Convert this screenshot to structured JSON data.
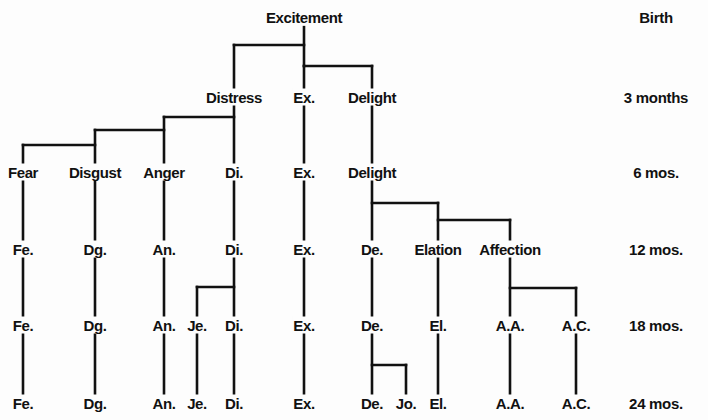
{
  "ages": [
    {
      "label": "Birth",
      "y": 17
    },
    {
      "label": "3 months",
      "y": 97
    },
    {
      "label": "6 mos.",
      "y": 172
    },
    {
      "label": "12 mos.",
      "y": 249
    },
    {
      "label": "18 mos.",
      "y": 325
    },
    {
      "label": "24 mos.",
      "y": 403
    }
  ],
  "nodes": [
    {
      "id": "excitement",
      "label": "Excitement",
      "x": 304,
      "y": 17
    },
    {
      "id": "distress-3",
      "label": "Distress",
      "x": 234,
      "y": 97
    },
    {
      "id": "ex-3",
      "label": "Ex.",
      "x": 304,
      "y": 97
    },
    {
      "id": "delight-3",
      "label": "Delight",
      "x": 372,
      "y": 97
    },
    {
      "id": "fear-6",
      "label": "Fear",
      "x": 23,
      "y": 172
    },
    {
      "id": "disgust-6",
      "label": "Disgust",
      "x": 95,
      "y": 172
    },
    {
      "id": "anger-6",
      "label": "Anger",
      "x": 164,
      "y": 172
    },
    {
      "id": "di-6",
      "label": "Di.",
      "x": 234,
      "y": 172
    },
    {
      "id": "ex-6",
      "label": "Ex.",
      "x": 304,
      "y": 172
    },
    {
      "id": "delight-6",
      "label": "Delight",
      "x": 372,
      "y": 172
    },
    {
      "id": "fe-12",
      "label": "Fe.",
      "x": 23,
      "y": 249
    },
    {
      "id": "dg-12",
      "label": "Dg.",
      "x": 95,
      "y": 249
    },
    {
      "id": "an-12",
      "label": "An.",
      "x": 164,
      "y": 249
    },
    {
      "id": "di-12",
      "label": "Di.",
      "x": 234,
      "y": 249
    },
    {
      "id": "ex-12",
      "label": "Ex.",
      "x": 304,
      "y": 249
    },
    {
      "id": "de-12",
      "label": "De.",
      "x": 372,
      "y": 249
    },
    {
      "id": "elation-12",
      "label": "Elation",
      "x": 438,
      "y": 249
    },
    {
      "id": "affection-12",
      "label": "Affection",
      "x": 510,
      "y": 249
    },
    {
      "id": "fe-18",
      "label": "Fe.",
      "x": 23,
      "y": 325
    },
    {
      "id": "dg-18",
      "label": "Dg.",
      "x": 95,
      "y": 325
    },
    {
      "id": "an-18",
      "label": "An.",
      "x": 164,
      "y": 325
    },
    {
      "id": "je-18",
      "label": "Je.",
      "x": 197,
      "y": 325
    },
    {
      "id": "di-18",
      "label": "Di.",
      "x": 234,
      "y": 325
    },
    {
      "id": "ex-18",
      "label": "Ex.",
      "x": 304,
      "y": 325
    },
    {
      "id": "de-18",
      "label": "De.",
      "x": 372,
      "y": 325
    },
    {
      "id": "el-18",
      "label": "El.",
      "x": 438,
      "y": 325
    },
    {
      "id": "aa-18",
      "label": "A.A.",
      "x": 510,
      "y": 325
    },
    {
      "id": "ac-18",
      "label": "A.C.",
      "x": 576,
      "y": 325
    },
    {
      "id": "fe-24",
      "label": "Fe.",
      "x": 23,
      "y": 403
    },
    {
      "id": "dg-24",
      "label": "Dg.",
      "x": 95,
      "y": 403
    },
    {
      "id": "an-24",
      "label": "An.",
      "x": 164,
      "y": 403
    },
    {
      "id": "je-24",
      "label": "Je.",
      "x": 197,
      "y": 403
    },
    {
      "id": "di-24",
      "label": "Di.",
      "x": 234,
      "y": 403
    },
    {
      "id": "ex-24",
      "label": "Ex.",
      "x": 304,
      "y": 403
    },
    {
      "id": "de-24",
      "label": "De.",
      "x": 372,
      "y": 403
    },
    {
      "id": "jo-24",
      "label": "Jo.",
      "x": 406,
      "y": 403
    },
    {
      "id": "el-24",
      "label": "El.",
      "x": 438,
      "y": 403
    },
    {
      "id": "aa-24",
      "label": "A.A.",
      "x": 510,
      "y": 403
    },
    {
      "id": "ac-24",
      "label": "A.C.",
      "x": 576,
      "y": 403
    }
  ],
  "lines": [
    [
      304,
      27,
      304,
      66
    ],
    [
      234,
      45,
      304,
      45
    ],
    [
      234,
      45,
      234,
      88
    ],
    [
      304,
      66,
      372,
      66
    ],
    [
      372,
      66,
      372,
      88
    ],
    [
      304,
      66,
      304,
      88
    ],
    [
      234,
      106,
      234,
      163
    ],
    [
      164,
      117,
      234,
      117
    ],
    [
      164,
      117,
      164,
      163
    ],
    [
      95,
      130,
      164,
      130
    ],
    [
      95,
      130,
      95,
      163
    ],
    [
      23,
      145,
      95,
      145
    ],
    [
      23,
      145,
      23,
      163
    ],
    [
      304,
      106,
      304,
      163
    ],
    [
      372,
      106,
      372,
      163
    ],
    [
      23,
      181,
      23,
      240
    ],
    [
      95,
      181,
      95,
      240
    ],
    [
      164,
      181,
      164,
      240
    ],
    [
      234,
      181,
      234,
      240
    ],
    [
      304,
      181,
      304,
      240
    ],
    [
      372,
      181,
      372,
      240
    ],
    [
      372,
      203,
      438,
      203
    ],
    [
      438,
      203,
      438,
      240
    ],
    [
      438,
      220,
      510,
      220
    ],
    [
      510,
      220,
      510,
      240
    ],
    [
      23,
      258,
      23,
      316
    ],
    [
      95,
      258,
      95,
      316
    ],
    [
      164,
      258,
      164,
      316
    ],
    [
      234,
      258,
      234,
      316
    ],
    [
      304,
      258,
      304,
      316
    ],
    [
      372,
      258,
      372,
      316
    ],
    [
      438,
      258,
      438,
      316
    ],
    [
      510,
      258,
      510,
      316
    ],
    [
      197,
      287,
      234,
      287
    ],
    [
      197,
      287,
      197,
      316
    ],
    [
      510,
      288,
      576,
      288
    ],
    [
      576,
      288,
      576,
      316
    ],
    [
      23,
      334,
      23,
      394
    ],
    [
      95,
      334,
      95,
      394
    ],
    [
      164,
      334,
      164,
      394
    ],
    [
      197,
      334,
      197,
      394
    ],
    [
      234,
      334,
      234,
      394
    ],
    [
      304,
      334,
      304,
      394
    ],
    [
      372,
      334,
      372,
      394
    ],
    [
      372,
      365,
      406,
      365
    ],
    [
      406,
      365,
      406,
      394
    ],
    [
      438,
      334,
      438,
      394
    ],
    [
      510,
      334,
      510,
      394
    ],
    [
      576,
      334,
      576,
      394
    ]
  ],
  "colors": {
    "ink": "#111111",
    "paper": "#fdfdfd"
  },
  "age_column_x": 656
}
